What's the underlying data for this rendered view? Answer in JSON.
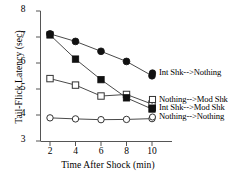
{
  "chart_data": {
    "type": "line",
    "title": "",
    "subtitle": "",
    "xlabel": "Time After Shock (min)",
    "ylabel": "Tail-Flick Latency (sec)",
    "x": [
      2,
      4,
      6,
      8,
      10
    ],
    "xtick_labels": [
      "2",
      "4",
      "6",
      "8",
      "10"
    ],
    "ytick_labels": [
      "3",
      "4",
      "5",
      "6",
      "7",
      "8"
    ],
    "xlim": [
      1,
      11
    ],
    "ylim": [
      3,
      8
    ],
    "grid": false,
    "legend_position": "inline-right",
    "series": [
      {
        "name": "Int Shk-->Nothing",
        "marker": "filled-circle",
        "values": [
          7.12,
          6.83,
          6.45,
          6.06,
          5.51
        ]
      },
      {
        "name": "Int Shk-->Mod Shk",
        "marker": "filled-square",
        "values": [
          7.08,
          6.15,
          5.36,
          4.66,
          4.23
        ]
      },
      {
        "name": "Nothing-->Mod Shk",
        "marker": "open-square",
        "values": [
          5.4,
          5.15,
          4.73,
          4.79,
          4.42
        ]
      },
      {
        "name": "Nothing-->Nothing",
        "marker": "open-circle",
        "values": [
          3.89,
          3.85,
          3.82,
          3.83,
          3.86
        ]
      }
    ]
  },
  "colors": {
    "line": "#4a4a4a",
    "marker_fill": "#111111",
    "marker_open": "#ffffff",
    "axis": "#555555",
    "text": "#000000"
  },
  "legend": [
    {
      "label": "Int Shk-->Nothing"
    },
    {
      "label": "Nothing-->Mod Shk"
    },
    {
      "label": "Int Shk-->Mod Shk"
    },
    {
      "label": "Nothing-->Nothing"
    }
  ]
}
